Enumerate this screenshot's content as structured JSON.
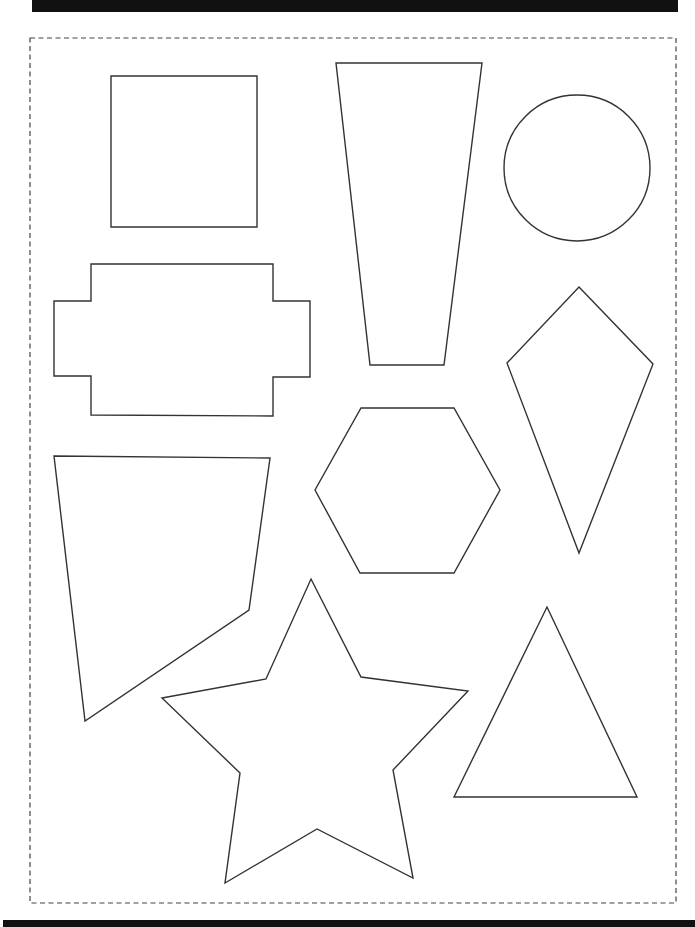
{
  "page": {
    "kind": "printable shapes worksheet",
    "colors": {
      "bars": "#111111",
      "outline": "#333333",
      "background": "#ffffff"
    }
  },
  "cut_border": {
    "style": "dashed",
    "x1": 30,
    "y1": 38,
    "x2": 676,
    "y2": 903
  },
  "shapes": [
    {
      "name": "square",
      "points": "111,76 257,76 257,227 111,227"
    },
    {
      "name": "trapezoid",
      "points": "336,63 482,63 444,365 370,365"
    },
    {
      "name": "circle",
      "cx": 577,
      "cy": 168,
      "r": 73
    },
    {
      "name": "cross-rectangle",
      "points": "91,264 273,264 273,301 310,301 310,377 273,377 273,416 91,415 91,376 54,376 54,301 91,301"
    },
    {
      "name": "kite",
      "points": "579,287 653,364 579,553 507,363"
    },
    {
      "name": "hexagon",
      "points": "361,408 454,408 500,490 454,573 360,573 315,490"
    },
    {
      "name": "irregular-quadrilateral",
      "points": "54,456 270,458 249,610 85,721"
    },
    {
      "name": "star",
      "points": "311,579 361,677 468,691 393,770 413,878 317,829 225,883 240,773 162,698 266,679"
    },
    {
      "name": "triangle",
      "points": "547,607 637,797 454,797"
    }
  ]
}
